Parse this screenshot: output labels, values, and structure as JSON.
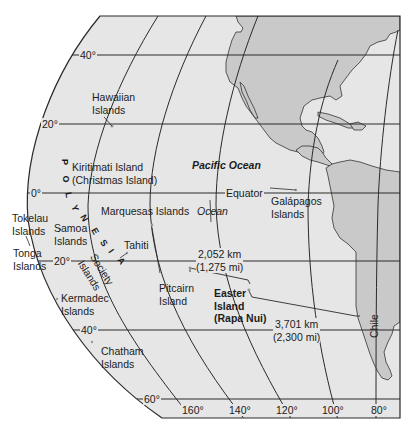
{
  "colors": {
    "ocean": "#e6e6e6",
    "land": "#c9c9c9",
    "grid_line": "#2a2a2a",
    "frame": "#2a2a2a",
    "background": "#ffffff"
  },
  "latitudes": [
    {
      "label": "40°",
      "y": 55
    },
    {
      "label": "20°",
      "y": 124
    },
    {
      "label": "0°",
      "y": 193
    },
    {
      "label": "20°",
      "y": 261
    },
    {
      "label": "40°",
      "y": 330
    },
    {
      "label": "60°",
      "y": 399
    }
  ],
  "longitudes": [
    {
      "label": "160°"
    },
    {
      "label": "140°"
    },
    {
      "label": "120°"
    },
    {
      "label": "100°"
    },
    {
      "label": "80°"
    }
  ],
  "labels": {
    "equator": "Equator",
    "pacific_ocean": "Pacific Ocean",
    "ocean": "Ocean",
    "polynesia_letters": [
      "P",
      "O",
      "L",
      "Y",
      "N",
      "E",
      "S",
      "I",
      "A"
    ],
    "hawaiian_islands": [
      "Hawaiian",
      "Islands"
    ],
    "kiritimati": [
      "Kiritimati Island",
      "(Christmas Island)"
    ],
    "marquesas": "Marquesas Islands",
    "tokelau": [
      "Tokelau",
      "Islands"
    ],
    "samoa": [
      "Samoa",
      "Islands"
    ],
    "tonga": [
      "Tonga",
      "Islands"
    ],
    "tahiti": "Tahiti",
    "society": [
      "Society",
      "Islands"
    ],
    "kermadec": [
      "Kermadec",
      "Islands"
    ],
    "chatham": [
      "Chatham",
      "Islands"
    ],
    "pitcairn": [
      "Pitcairn",
      "Island"
    ],
    "easter": [
      "Easter",
      "Island",
      "(Rapa Nui)"
    ],
    "galapagos": [
      "Galápagos",
      "Islands"
    ],
    "chile": "Chile",
    "distance_1": [
      "2,052 km",
      "(1,275 mi)"
    ],
    "distance_2": [
      "3,701 km",
      "(2,300 mi)"
    ]
  }
}
